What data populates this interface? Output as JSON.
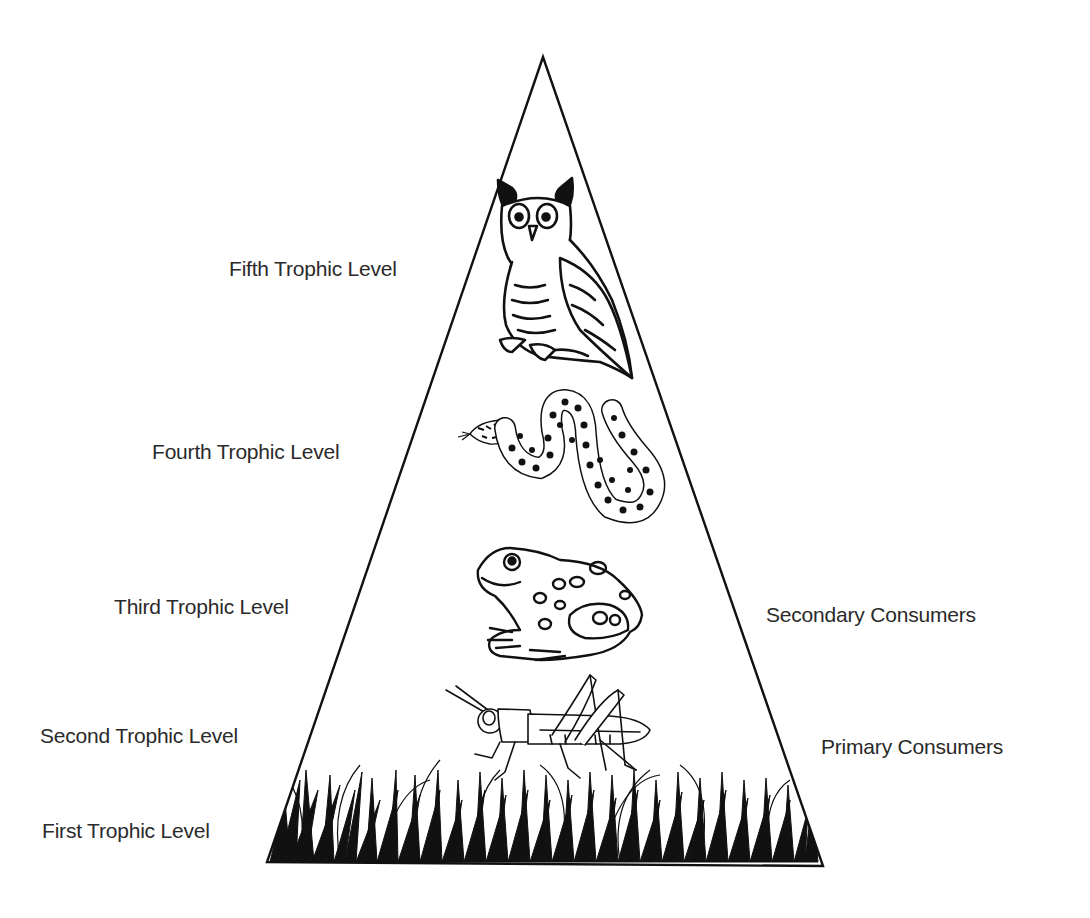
{
  "diagram": {
    "type": "ecological-pyramid",
    "left_labels": [
      {
        "id": "fifth",
        "text": "Fifth Trophic Level"
      },
      {
        "id": "fourth",
        "text": "Fourth Trophic Level"
      },
      {
        "id": "third",
        "text": "Third Trophic Level"
      },
      {
        "id": "second",
        "text": "Second Trophic Level"
      },
      {
        "id": "first",
        "text": "First Trophic Level"
      }
    ],
    "right_labels": [
      {
        "id": "secondary",
        "text": "Secondary Consumers"
      },
      {
        "id": "primary",
        "text": "Primary Consumers"
      }
    ],
    "levels": [
      {
        "level": 5,
        "organism": "owl"
      },
      {
        "level": 4,
        "organism": "snake"
      },
      {
        "level": 3,
        "organism": "frog"
      },
      {
        "level": 2,
        "organism": "grasshopper"
      },
      {
        "level": 1,
        "organism": "grass"
      }
    ],
    "colors": {
      "line": "#111111",
      "text": "#2a2a2a",
      "background": "#ffffff"
    }
  }
}
